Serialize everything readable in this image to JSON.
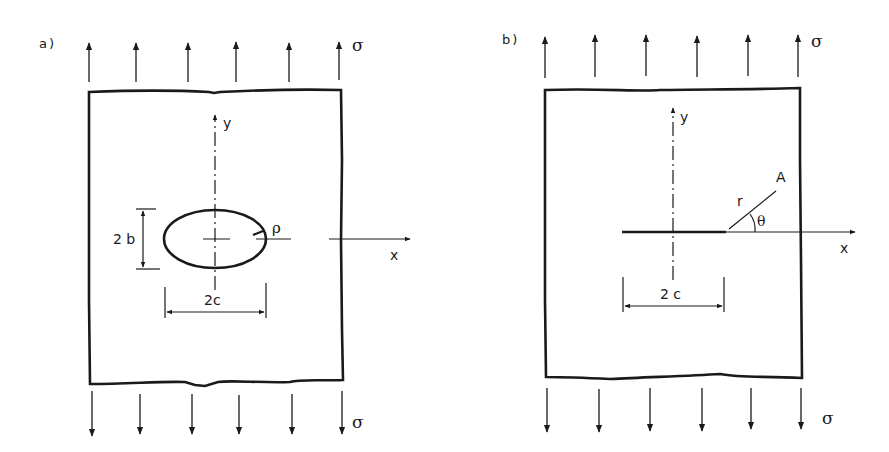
{
  "figure": {
    "panel_a": {
      "label": "a)",
      "stress_top": "σ",
      "stress_bottom": "σ",
      "y_axis": "y",
      "x_axis": "x",
      "height_dim": "2 b",
      "width_dim": "2c",
      "radius_label": "ρ",
      "description": "Plate with elliptical hole under uniaxial tension"
    },
    "panel_b": {
      "label": "b)",
      "stress_top": "σ",
      "stress_bottom": "σ",
      "y_axis": "y",
      "x_axis": "x",
      "crack_dim": "2 c",
      "point_label": "A",
      "radius_label": "r",
      "angle_label": "θ",
      "description": "Plate with central crack under uniaxial tension"
    },
    "colors": {
      "ink": "#1a1a1a",
      "background": "#ffffff"
    }
  }
}
